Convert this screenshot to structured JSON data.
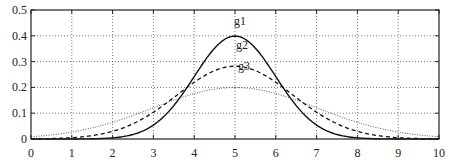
{
  "chart_data": {
    "type": "line",
    "title": "",
    "xlabel": "",
    "ylabel": "",
    "xlim": [
      0,
      10
    ],
    "ylim": [
      0,
      0.5
    ],
    "grid": true,
    "x_ticks": [
      "0",
      "1",
      "2",
      "3",
      "4",
      "5",
      "6",
      "7",
      "8",
      "9",
      "10"
    ],
    "y_ticks": [
      "0",
      "0.1",
      "0.2",
      "0.3",
      "0.4",
      "0.5"
    ],
    "legend": "inline labels above peaks",
    "series": [
      {
        "name": "g1",
        "style": "solid",
        "mean": 5,
        "sigma": 1.0,
        "peak": 0.4,
        "x": [
          0,
          1,
          2,
          3,
          4,
          4.5,
          5,
          5.5,
          6,
          7,
          8,
          9,
          10
        ],
        "y": [
          0.0,
          0.0001,
          0.0044,
          0.054,
          0.242,
          0.352,
          0.399,
          0.352,
          0.242,
          0.054,
          0.0044,
          0.0001,
          0.0
        ]
      },
      {
        "name": "g2",
        "style": "dashed",
        "mean": 5,
        "sigma": 1.414,
        "peak": 0.28,
        "x": [
          0,
          1,
          2,
          3,
          4,
          5,
          6,
          7,
          8,
          9,
          10
        ],
        "y": [
          0.0011,
          0.0052,
          0.0297,
          0.104,
          0.22,
          0.282,
          0.22,
          0.104,
          0.0297,
          0.0052,
          0.0011
        ]
      },
      {
        "name": "g3",
        "style": "dotted",
        "mean": 5,
        "sigma": 2.0,
        "peak": 0.2,
        "x": [
          0,
          1,
          2,
          3,
          4,
          5,
          6,
          7,
          8,
          9,
          10
        ],
        "y": [
          0.0088,
          0.027,
          0.065,
          0.121,
          0.176,
          0.199,
          0.176,
          0.121,
          0.065,
          0.027,
          0.0088
        ]
      }
    ]
  },
  "labels": {
    "g1": "g1",
    "g2": "g2",
    "g3": "g3"
  }
}
